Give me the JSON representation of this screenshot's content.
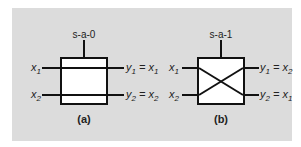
{
  "colors": {
    "panel": "#dcdcdc",
    "box_fill": "#ffffff",
    "stroke": "#111111",
    "text": "#222222"
  },
  "diagram_a": {
    "caption": "(a)",
    "fault": "s-a-0",
    "inputs": {
      "x1": "x",
      "x1_sub": "1",
      "x2": "x",
      "x2_sub": "2"
    },
    "outputs": {
      "y1": "y",
      "y1_sub": "1",
      "y1_eq": " = x",
      "y1_eq_sub": "1",
      "y2": "y",
      "y2_sub": "2",
      "y2_eq": " = x",
      "y2_eq_sub": "2"
    },
    "type": "straight"
  },
  "diagram_b": {
    "caption": "(b)",
    "fault": "s-a-1",
    "inputs": {
      "x1": "x",
      "x1_sub": "1",
      "x2": "x",
      "x2_sub": "2"
    },
    "outputs": {
      "y1": "y",
      "y1_sub": "1",
      "y1_eq": " = x",
      "y1_eq_sub": "2",
      "y2": "y",
      "y2_sub": "2",
      "y2_eq": " = x",
      "y2_eq_sub": "1"
    },
    "type": "crossed"
  }
}
